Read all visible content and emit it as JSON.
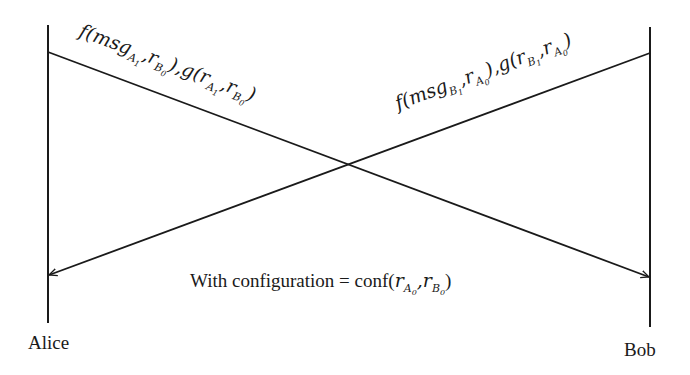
{
  "diagram": {
    "type": "sequence",
    "colors": {
      "line": "#1a1a1a",
      "background": "#ffffff",
      "text": "#1a1a1a"
    },
    "participants": [
      {
        "name": "Alice",
        "x": 48
      },
      {
        "name": "Bob",
        "x": 650
      }
    ],
    "messages": [
      {
        "from": "Alice",
        "to": "Bob",
        "label": "f(msg_{A_1}, r_{B_0}), g(r_{A_1}, r_{B_0})",
        "parts": {
          "f": "f(msg",
          "A": "A",
          "one": "1",
          "comma1": ",",
          "r1": "r",
          "B": "B",
          "zero": "0",
          "close_comma": "),",
          "g": "g(r",
          "A2": "A",
          "one2": "1",
          "comma2": ",",
          "r2": "r",
          "B2": "B",
          "zero2": "0",
          "close": ")"
        }
      },
      {
        "from": "Bob",
        "to": "Alice",
        "label": "f(msg_{B_1}, r_{A_0}), g(r_{B_1}, r_{A_0})",
        "parts": {
          "f": "f(msg",
          "B": "B",
          "one": "1",
          "comma1": ",",
          "r1": "r",
          "A": "A",
          "zero": "0",
          "close_comma": "),",
          "g": "g(r",
          "B2": "B",
          "one2": "1",
          "comma2": ",",
          "r2": "r",
          "A2": "A",
          "zero2": "0",
          "close": ")"
        }
      }
    ],
    "note": {
      "text_prefix": "With configuration = conf(",
      "r1": "r",
      "A": "A",
      "zero1": "0",
      "comma": ",",
      "r2": "r",
      "B": "B",
      "zero2": "0",
      "close": ")",
      "full": "With configuration = conf(r_{A_0}, r_{B_0})"
    }
  }
}
